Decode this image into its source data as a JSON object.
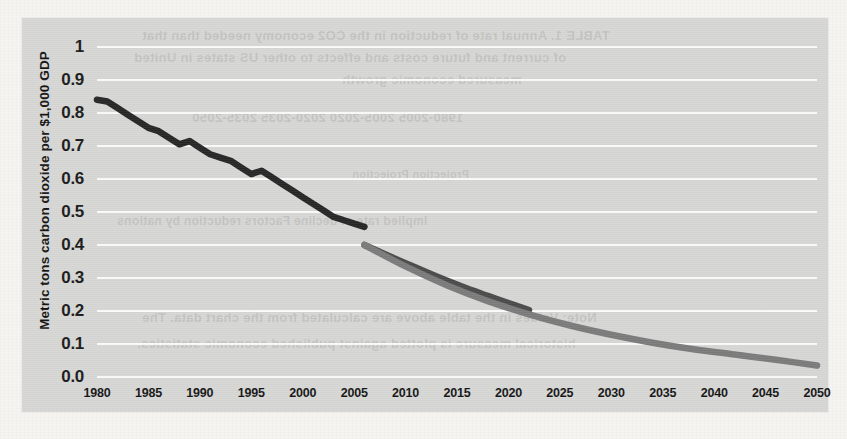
{
  "chart_data": {
    "type": "line",
    "title": "",
    "xlabel": "",
    "ylabel": "Metric tons carbon dioxide per $1,000 GDP",
    "xlim": [
      1980,
      2050
    ],
    "ylim": [
      0.0,
      1.0
    ],
    "grid": true,
    "legend": "none",
    "x_ticks": [
      "1980",
      "1985",
      "1990",
      "1995",
      "2000",
      "2005",
      "2010",
      "2015",
      "2020",
      "2025",
      "2030",
      "2035",
      "2040",
      "2045",
      "2050"
    ],
    "y_ticks": [
      "1",
      "0.9",
      "0.8",
      "0.7",
      "0.6",
      "0.5",
      "0.4",
      "0.3",
      "0.2",
      "0.1",
      "0.0"
    ],
    "series": [
      {
        "name": "History",
        "color": "#262626",
        "x": [
          1980,
          1981,
          1982,
          1983,
          1984,
          1985,
          1986,
          1987,
          1988,
          1989,
          1990,
          1991,
          1992,
          1993,
          1994,
          1995,
          1996,
          1997,
          1998,
          1999,
          2000,
          2001,
          2002,
          2003,
          2004,
          2005,
          2006
        ],
        "values": [
          0.84,
          0.835,
          0.815,
          0.795,
          0.775,
          0.755,
          0.745,
          0.725,
          0.705,
          0.715,
          0.695,
          0.675,
          0.665,
          0.655,
          0.635,
          0.615,
          0.625,
          0.605,
          0.585,
          0.565,
          0.545,
          0.525,
          0.505,
          0.485,
          0.475,
          0.465,
          0.455
        ]
      },
      {
        "name": "Projection high",
        "color": "#4a4a4a",
        "x": [
          2006,
          2008,
          2010,
          2012,
          2014,
          2016,
          2018,
          2020,
          2022
        ],
        "values": [
          0.4,
          0.372,
          0.345,
          0.318,
          0.292,
          0.268,
          0.246,
          0.224,
          0.203
        ]
      },
      {
        "name": "Projection low",
        "color": "#7a7a7a",
        "x": [
          2006,
          2010,
          2014,
          2018,
          2022,
          2026,
          2030,
          2034,
          2038,
          2042,
          2046,
          2050
        ],
        "values": [
          0.4,
          0.335,
          0.278,
          0.23,
          0.19,
          0.156,
          0.128,
          0.104,
          0.084,
          0.068,
          0.052,
          0.035
        ]
      }
    ]
  },
  "history_tail_values": [
    0.455,
    0.445,
    0.435,
    0.425,
    0.415,
    0.405,
    0.4
  ],
  "ghost_text": {
    "line1": "TABLE 1. Annual rate of reduction in the CO2 economy needed than that",
    "line2": "of current and future costs and effects to other US states in United",
    "line3": "measured economic growth",
    "line4": "1980-2005          2005-2020          2020-2035          2035-2050",
    "line5": "Projection                 Projection",
    "line6": "Implied rate of decline                    Factors                   reduction by nations",
    "line7": "Note: Values in the table above are calculated from the chart data. The",
    "line8": "historical measure is plotted against published economic statistics."
  }
}
